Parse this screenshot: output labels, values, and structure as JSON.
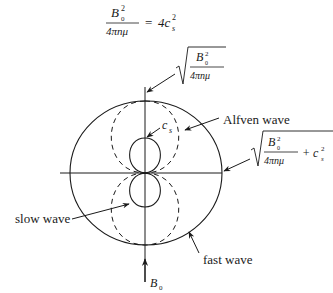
{
  "equation": {
    "lhs_numerator": "B",
    "lhs_numerator_sub": "0",
    "lhs_numerator_sup": "2",
    "lhs_denominator": "4πnμ",
    "equals": "=",
    "rhs": "4c",
    "rhs_sub": "s",
    "rhs_sup": "2"
  },
  "labels": {
    "alfven_speed": {
      "numerator": "B",
      "numerator_sub": "0",
      "numerator_sup": "2",
      "denominator": "4πnμ"
    },
    "fast_speed": {
      "numerator": "B",
      "numerator_sub": "0",
      "numerator_sup": "2",
      "denominator": "4πnμ",
      "plus": "+ c",
      "plus_sub": "s",
      "plus_sup": "2"
    },
    "sound_speed": "c",
    "sound_speed_sub": "s",
    "alfven_wave": "Alfven wave",
    "slow_wave": "slow wave",
    "fast_wave": "fast wave",
    "field": "B",
    "field_sub": "0"
  },
  "colors": {
    "stroke": "#1a1a1a",
    "background": "#ffffff"
  }
}
